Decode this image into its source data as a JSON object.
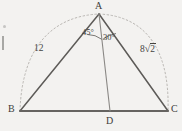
{
  "figure": {
    "kind": "geometry-diagram",
    "shape": "triangle-with-cevian",
    "background_color": "#f3f2f0",
    "stroke_color": "#5a5856",
    "dashed_color": "#b3b0ac",
    "vertices": {
      "A": {
        "label": "A",
        "x": 99,
        "y": 14
      },
      "B": {
        "label": "B",
        "x": 20,
        "y": 111
      },
      "C": {
        "label": "C",
        "x": 168,
        "y": 111
      },
      "D": {
        "label": "D",
        "x": 110,
        "y": 111
      }
    },
    "segments": [
      {
        "name": "side-AB",
        "from": "A",
        "to": "B"
      },
      {
        "name": "side-AC",
        "from": "A",
        "to": "C"
      },
      {
        "name": "side-BC",
        "from": "B",
        "to": "C"
      },
      {
        "name": "cevian-AD",
        "from": "A",
        "to": "D"
      }
    ],
    "side_labels": [
      {
        "name": "label-AB-length",
        "text": "12",
        "x": 35,
        "y": 44
      },
      {
        "name": "label-AC-length",
        "text": "8",
        "radical": "2",
        "x": 140,
        "y": 44
      }
    ],
    "angle_labels": [
      {
        "name": "angle-BAD",
        "text": "45°",
        "x": 83,
        "y": 29,
        "value": 45
      },
      {
        "name": "angle-DAC",
        "text": "30°",
        "x": 103,
        "y": 33,
        "value": 30
      }
    ],
    "arcs": [
      {
        "name": "circumscribing-dashed-arc",
        "style": "dashed",
        "from": "B",
        "over": "A",
        "to": "C"
      },
      {
        "name": "angle-arc-BAD",
        "style": "solid",
        "at": "A"
      },
      {
        "name": "angle-arc-DAC",
        "style": "solid",
        "at": "A"
      }
    ]
  }
}
